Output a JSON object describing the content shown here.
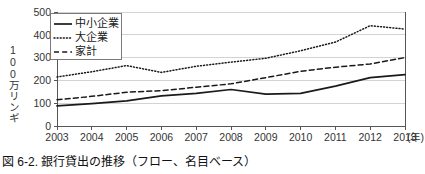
{
  "figure": {
    "caption": "図 6-2. 銀行貸出の推移（フロー、名目ベース）",
    "y_axis_label": "100万リンギ",
    "x_unit_label": "(年)"
  },
  "chart_data": {
    "type": "line",
    "title": "",
    "subtitle": "",
    "xlabel": "(年)",
    "ylabel": "100万リンギ",
    "categories": [
      "2003",
      "2004",
      "2005",
      "2006",
      "2007",
      "2008",
      "2009",
      "2010",
      "2011",
      "2012",
      "2013"
    ],
    "x": [
      2003,
      2004,
      2005,
      2006,
      2007,
      2008,
      2009,
      2010,
      2011,
      2012,
      2013
    ],
    "xlim": [
      2003,
      2013
    ],
    "ylim": [
      0,
      500
    ],
    "yticks": [
      0,
      100,
      200,
      300,
      400,
      500
    ],
    "ytick_labels": [
      "0",
      "100",
      "200",
      "300",
      "400",
      "500"
    ],
    "xtick_labels": [
      "2003",
      "2004",
      "2005",
      "2006",
      "2007",
      "2008",
      "2009",
      "2010",
      "2011",
      "2012",
      "2013"
    ],
    "grid": "horizontal",
    "legend_position": "top-left",
    "series": [
      {
        "name": "中小企業",
        "style": "solid",
        "color": "#1a1a1a",
        "values": [
          88,
          98,
          110,
          132,
          143,
          160,
          140,
          143,
          175,
          212,
          225
        ]
      },
      {
        "name": "大企業",
        "style": "dotted",
        "color": "#1a1a1a",
        "values": [
          215,
          238,
          265,
          235,
          262,
          280,
          297,
          330,
          368,
          440,
          425
        ]
      },
      {
        "name": "家計",
        "style": "dashed",
        "color": "#1a1a1a",
        "values": [
          115,
          130,
          148,
          155,
          170,
          185,
          212,
          240,
          258,
          272,
          300
        ]
      }
    ]
  }
}
